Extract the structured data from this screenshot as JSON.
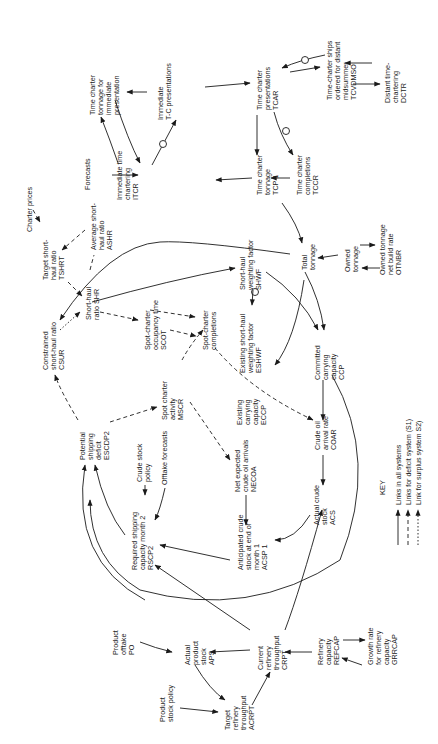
{
  "diagram": {
    "type": "causal-loop-diagram",
    "orientation": "rotated 90 degrees counter-clockwise",
    "nodes": [
      {
        "id": "ttip",
        "label": [
          "Time charter",
          "tonnage for",
          "immediate",
          "presentation"
        ]
      },
      {
        "id": "itcp",
        "label": [
          "Immediate",
          "T-C presentations"
        ]
      },
      {
        "id": "tcar",
        "label": [
          "Time charter",
          "presentations",
          "TCAR"
        ]
      },
      {
        "id": "tcvdmso",
        "label": [
          "Time-charter ships",
          "ordered for distant",
          "midsummer",
          "TCVDMSO"
        ]
      },
      {
        "id": "dctr",
        "label": [
          "Distant time-",
          "chartering",
          "DCTR"
        ]
      },
      {
        "id": "forecasts",
        "label": [
          "Forecasts"
        ]
      },
      {
        "id": "itcr",
        "label": [
          "Immediate time",
          "chartering",
          "ITCR"
        ]
      },
      {
        "id": "tcp1",
        "label": [
          "Time charter",
          "tonnage",
          "TCP 1"
        ]
      },
      {
        "id": "tccr",
        "label": [
          "Time charter",
          "completions",
          "TCCR"
        ]
      },
      {
        "id": "charter_prices",
        "label": [
          "Charter prices"
        ]
      },
      {
        "id": "tshrt",
        "label": [
          "Target short-",
          "haul ratio",
          "TSHRT"
        ]
      },
      {
        "id": "ashr",
        "label": [
          "Average short-",
          "haul ratio",
          "ASHR"
        ]
      },
      {
        "id": "shr",
        "label": [
          "Short-haul",
          "ratio SHR"
        ]
      },
      {
        "id": "csur",
        "label": [
          "Constrained",
          "short-haul ratio",
          "CSUR"
        ]
      },
      {
        "id": "scot",
        "label": [
          "Spot-charter",
          "occupancy time",
          "SCOT"
        ]
      },
      {
        "id": "scc",
        "label": [
          "Spot-charter",
          "completions"
        ]
      },
      {
        "id": "shwf",
        "label": [
          "Short-haul",
          "weighting factor",
          "SHWF"
        ]
      },
      {
        "id": "eshwf",
        "label": [
          "Existing short-haul",
          "weighting factor",
          "ESHWF"
        ]
      },
      {
        "id": "total_tonnage",
        "label": [
          "Total",
          "tonnage"
        ]
      },
      {
        "id": "owned_tonnage",
        "label": [
          "Owned",
          "tonnage"
        ]
      },
      {
        "id": "otnbr",
        "label": [
          "Owned tonnage",
          "net build rate",
          "OTNBR"
        ]
      },
      {
        "id": "ccp",
        "label": [
          "Committed",
          "carrying",
          "capacity",
          "CCP"
        ]
      },
      {
        "id": "escdp2",
        "label": [
          "Potential",
          "shipping",
          "deficit",
          "ESCDP2"
        ]
      },
      {
        "id": "mscr",
        "label": [
          "Spot charter",
          "activity",
          "MSCR"
        ]
      },
      {
        "id": "eccp",
        "label": [
          "Existing",
          "carrying",
          "capacity",
          "ECCP"
        ]
      },
      {
        "id": "crude_stock_policy",
        "label": [
          "Crude stock",
          "policy"
        ]
      },
      {
        "id": "offtake_forecasts",
        "label": [
          "Offtake forecasts"
        ]
      },
      {
        "id": "necoa",
        "label": [
          "Net expected",
          "crude oil arrivals",
          "NECOA"
        ]
      },
      {
        "id": "coar",
        "label": [
          "Crude oil",
          "arrival rate",
          "COAR"
        ]
      },
      {
        "id": "rscp2",
        "label": [
          "Required shipping",
          "capacity month 2",
          "RSCP2"
        ]
      },
      {
        "id": "acsp1",
        "label": [
          "Anticipated crude",
          "stock at end of",
          "month 1",
          "ACSP 1"
        ]
      },
      {
        "id": "acs",
        "label": [
          "Actual crude",
          "stock",
          "ACS"
        ]
      },
      {
        "id": "po",
        "label": [
          "Product",
          "offtake",
          "PO"
        ]
      },
      {
        "id": "aps",
        "label": [
          "Actual",
          "product",
          "stock",
          "APS"
        ]
      },
      {
        "id": "crpt",
        "label": [
          "Current",
          "refinery",
          "throughput",
          "CRPT"
        ]
      },
      {
        "id": "refcap",
        "label": [
          "Refinery",
          "capacity",
          "REFCAP"
        ]
      },
      {
        "id": "grrcap",
        "label": [
          "Growth rate",
          "for refinery",
          "capacity",
          "GRRCAP"
        ]
      },
      {
        "id": "psp",
        "label": [
          "Product",
          "stock policy"
        ]
      },
      {
        "id": "acrpt",
        "label": [
          "Target",
          "refinery",
          "throughput",
          "ACRPT"
        ]
      }
    ],
    "key": {
      "title": "KEY",
      "items": [
        {
          "style": "solid",
          "label": "Links in all systems"
        },
        {
          "style": "dashed",
          "label": "Links for deficit system (S1)"
        },
        {
          "style": "dotted",
          "label": "Link for surplus system S2)"
        }
      ]
    }
  }
}
